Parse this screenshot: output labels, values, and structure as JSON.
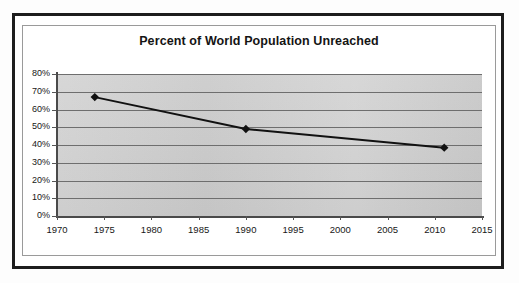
{
  "chart_data": {
    "type": "line",
    "title": "Percent of World Population Unreached",
    "xlabel": "",
    "ylabel": "",
    "x": [
      1974,
      1990,
      2011
    ],
    "values": [
      67,
      49,
      38.5
    ],
    "series": [
      {
        "name": "Percent of World Population Unreached",
        "x": [
          1974,
          1990,
          2011
        ],
        "values": [
          67,
          49,
          38.5
        ]
      }
    ],
    "xlim": [
      1970,
      2015
    ],
    "ylim": [
      0,
      80
    ],
    "xticks": [
      1970,
      1975,
      1980,
      1985,
      1990,
      1995,
      2000,
      2005,
      2010,
      2015
    ],
    "xtick_labels": [
      "1970",
      "1975",
      "1980",
      "1985",
      "1990",
      "1995",
      "2000",
      "2005",
      "2010",
      "2015"
    ],
    "yticks": [
      0,
      10,
      20,
      30,
      40,
      50,
      60,
      70,
      80
    ],
    "ytick_labels": [
      "0%",
      "10%",
      "20%",
      "30%",
      "40%",
      "50%",
      "60%",
      "70%",
      "80%"
    ],
    "grid": "horizontal",
    "legend": "none",
    "marker": "diamond",
    "line_color": "#111111",
    "marker_color": "#111111",
    "plot_background": "#cfcfcf",
    "gridline_color": "#6e6e6e"
  }
}
